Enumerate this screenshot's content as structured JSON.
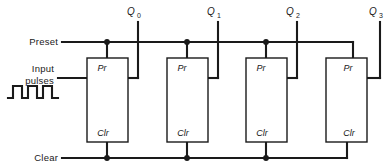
{
  "diagram": {
    "colors": {
      "wire": "#1a1a1a",
      "background": "#ffffff",
      "box_fill": "#ffffff"
    },
    "signals": {
      "preset_label": "Preset",
      "input_pulses_label_line1": "Input",
      "input_pulses_label_line2": "pulses",
      "clear_label": "Clear"
    },
    "outputs": [
      {
        "base": "Q",
        "sub": "0",
        "full": "Q0"
      },
      {
        "base": "Q",
        "sub": "1",
        "full": "Q1"
      },
      {
        "base": "Q",
        "sub": "2",
        "full": "Q2"
      },
      {
        "base": "Q",
        "sub": "3",
        "full": "Q3"
      }
    ],
    "flipflops": [
      {
        "index": 0,
        "preset_pin": "Pr",
        "clear_pin": "Clr"
      },
      {
        "index": 1,
        "preset_pin": "Pr",
        "clear_pin": "Clr"
      },
      {
        "index": 2,
        "preset_pin": "Pr",
        "clear_pin": "Clr"
      },
      {
        "index": 3,
        "preset_pin": "Pr",
        "clear_pin": "Clr"
      }
    ],
    "waveform": {
      "name": "input-pulse-train",
      "pulse_count": 3,
      "description": "square wave clock pulses"
    }
  }
}
